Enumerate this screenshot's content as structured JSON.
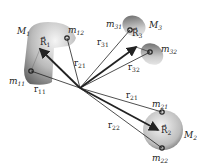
{
  "diagram": {
    "type": "multi-body position vectors",
    "origin": {
      "x": 80,
      "y": 88
    },
    "bodies": [
      {
        "id": "M1",
        "label": "M",
        "sub": "1",
        "center_label": "R",
        "center_sub": "1",
        "points": [
          {
            "label": "m",
            "sub": "11"
          },
          {
            "label": "m",
            "sub": "12"
          }
        ]
      },
      {
        "id": "M2",
        "label": "M",
        "sub": "2",
        "center_label": "R",
        "center_sub": "2",
        "points": [
          {
            "label": "m",
            "sub": "21"
          },
          {
            "label": "m",
            "sub": "22"
          }
        ]
      },
      {
        "id": "M3",
        "label": "M",
        "sub": "3",
        "center_label": "R",
        "center_sub": "3",
        "points": [
          {
            "label": "m",
            "sub": "31"
          },
          {
            "label": "m",
            "sub": "32"
          }
        ]
      }
    ],
    "vectors": [
      {
        "label": "r",
        "sub": "11"
      },
      {
        "label": "r",
        "sub": "21"
      },
      {
        "label": "r",
        "sub": "31"
      },
      {
        "label": "r",
        "sub": "32"
      },
      {
        "label": "r",
        "sub": "21"
      },
      {
        "label": "r",
        "sub": "22"
      }
    ],
    "colors": {
      "body_dark": "#555555",
      "body_light": "#eeeeee",
      "line": "#222222"
    }
  }
}
